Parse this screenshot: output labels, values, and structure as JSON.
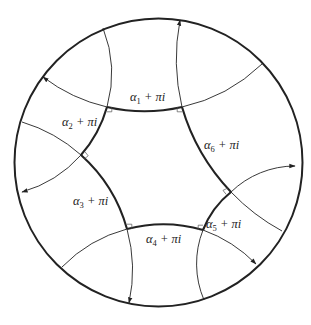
{
  "figure": {
    "colors": {
      "stroke": "#222222",
      "background": "#ffffff"
    },
    "disk": {
      "cx": 158.5,
      "cy": 162.5,
      "r": 144
    },
    "vertices": {
      "A": [
        107,
        107
      ],
      "B": [
        182,
        107
      ],
      "C": [
        231,
        192
      ],
      "D": [
        203,
        230
      ],
      "E": [
        127,
        229
      ],
      "F": [
        81,
        155
      ]
    },
    "geodesics": [
      {
        "id": "g1",
        "start": [
          43,
          77
        ],
        "p1": [
          107,
          107
        ],
        "p2": [
          182,
          107
        ],
        "end": [
          262,
          64
        ],
        "arrow_at": "start"
      },
      {
        "id": "g2",
        "start": [
          103,
          28
        ],
        "p1": [
          107,
          107
        ],
        "p2": [
          81,
          155
        ],
        "end": [
          22,
          192
        ],
        "arrow_at": "end"
      },
      {
        "id": "g3",
        "start": [
          22,
          122
        ],
        "p1": [
          81,
          155
        ],
        "p2": [
          127,
          229
        ],
        "end": [
          129,
          303
        ],
        "arrow_at": "end"
      },
      {
        "id": "g4",
        "start": [
          62,
          267
        ],
        "p1": [
          127,
          229
        ],
        "p2": [
          203,
          230
        ],
        "end": [
          256,
          264
        ],
        "arrow_at": "end"
      },
      {
        "id": "g5",
        "start": [
          204,
          300
        ],
        "p1": [
          203,
          230
        ],
        "p2": [
          231,
          192
        ],
        "end": [
          295,
          166
        ],
        "arrow_at": "end"
      },
      {
        "id": "g6",
        "start": [
          282,
          231
        ],
        "p1": [
          231,
          192
        ],
        "p2": [
          182,
          107
        ],
        "end": [
          180,
          20
        ],
        "arrow_at": "end"
      }
    ],
    "labels": [
      {
        "id": "side1",
        "alpha": "α",
        "sub": "1",
        "suffix": " + πi",
        "x": 130,
        "y": 101
      },
      {
        "id": "side2",
        "alpha": "α",
        "sub": "2",
        "suffix": " + πi",
        "x": 62,
        "y": 126
      },
      {
        "id": "side3",
        "alpha": "α",
        "sub": "3",
        "suffix": " + πi",
        "x": 73,
        "y": 205
      },
      {
        "id": "side4",
        "alpha": "α",
        "sub": "4",
        "suffix": " + πi",
        "x": 146,
        "y": 243
      },
      {
        "id": "side5",
        "alpha": "α",
        "sub": "5",
        "suffix": " + πi",
        "x": 206,
        "y": 228
      },
      {
        "id": "side6",
        "alpha": "α",
        "sub": "6",
        "suffix": " + πi",
        "x": 204,
        "y": 149
      }
    ]
  }
}
